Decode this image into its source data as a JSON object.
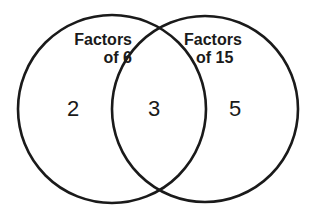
{
  "diagram": {
    "type": "venn",
    "sets": [
      {
        "label_line1": "Factors",
        "label_line2": "of 6",
        "only_values": "2"
      },
      {
        "label_line1": "Factors",
        "label_line2": "of 15",
        "only_values": "5"
      }
    ],
    "intersection": "3",
    "stroke_color": "#1a1a1a"
  }
}
